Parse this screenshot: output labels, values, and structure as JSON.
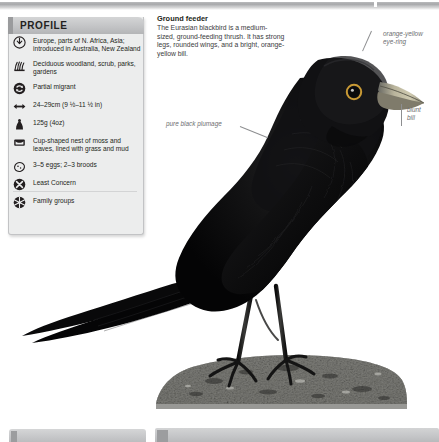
{
  "panel": {
    "title": "PROFILE",
    "rows": [
      {
        "icon": "globe-range-icon",
        "text": "Europe, parts of N. Africa, Asia; introduced in Australia, New Zealand"
      },
      {
        "icon": "habitat-grass-icon",
        "text": "Deciduous woodland, scrub, parks, gardens"
      },
      {
        "icon": "migration-arrow-icon",
        "text": "Partial migrant"
      },
      {
        "icon": "size-arrows-icon",
        "text": "24–29cm (9 ½–11 ½ in)"
      },
      {
        "icon": "weight-icon",
        "text": "125g (4oz)"
      },
      {
        "icon": "nest-icon",
        "text": "Cup-shaped nest of moss and leaves, lined with grass and mud"
      },
      {
        "icon": "egg-icon",
        "text": "3–5 eggs; 2–3 broods"
      },
      {
        "icon": "conservation-status-icon",
        "text": "Least Concern"
      },
      {
        "icon": "social-group-icon",
        "text": "Family groups"
      }
    ]
  },
  "caption": {
    "title": "Ground feeder",
    "body": "The Eurasian blackbird is a medium-sized, ground-feeding thrush. It has strong legs, rounded wings, and a bright, orange-yellow bill."
  },
  "annotations": {
    "eye_ring": "orange-yellow\neye-ring",
    "bill": "blunt\nbill",
    "plumage": "pure black plumage"
  },
  "colors": {
    "panel_bg": "#eceded",
    "panel_header": "#c3c4c6",
    "text": "#231f20",
    "annotation": "#6d6e70",
    "bill_orange": "#d6a23a",
    "plumage_black": "#0a0a0a",
    "rock_grey": "#8c8d8a"
  }
}
